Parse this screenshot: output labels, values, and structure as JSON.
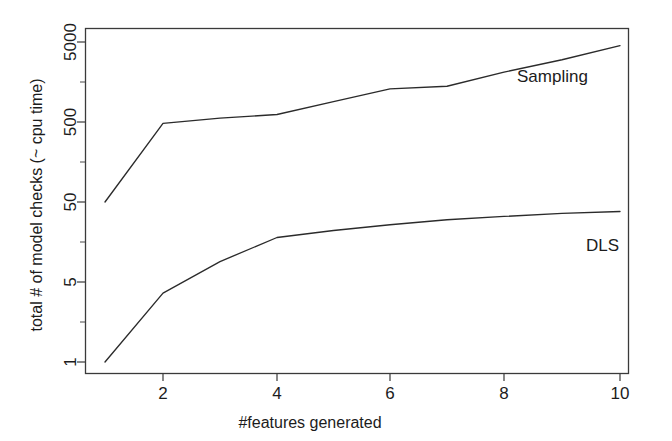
{
  "chart_data": {
    "type": "line",
    "title": "",
    "xlabel": "#features generated",
    "ylabel": "total # of model checks (~ cpu time)",
    "yscale": "log",
    "xlim": [
      1,
      10
    ],
    "ylim": [
      1,
      5000
    ],
    "grid": false,
    "legend_position": "inline-right",
    "x_ticks": [
      2,
      4,
      6,
      8,
      10
    ],
    "x_tick_labels": [
      "2",
      "4",
      "6",
      "8",
      "10"
    ],
    "y_ticks": [
      1,
      5,
      50,
      500,
      5000
    ],
    "y_tick_labels": [
      "1",
      "5",
      "50",
      "500",
      "5000"
    ],
    "x": [
      1,
      2,
      3,
      4,
      5,
      6,
      7,
      8,
      9,
      10
    ],
    "series": [
      {
        "name": "Sampling",
        "label": "Sampling",
        "color": "#2b2b2b",
        "values": [
          50,
          480,
          560,
          620,
          900,
          1300,
          1400,
          2100,
          3000,
          4500
        ]
      },
      {
        "name": "DLS",
        "label": "DLS",
        "color": "#2b2b2b",
        "values": [
          1,
          4,
          9,
          18,
          22,
          26,
          30,
          33,
          36,
          38
        ]
      }
    ],
    "annotations": [
      {
        "text": "Sampling",
        "x": 8.0,
        "y": 1150
      },
      {
        "text": "DLS",
        "x": 9.6,
        "y": 19
      }
    ]
  },
  "axis": {
    "x_title": "#features generated",
    "y_title": "total # of model checks (~ cpu time)"
  }
}
